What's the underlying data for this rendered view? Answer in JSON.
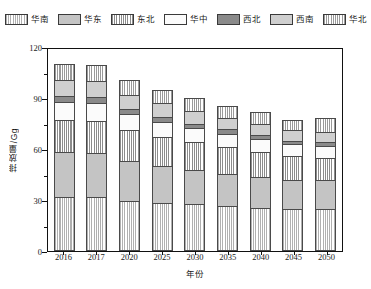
{
  "chart_data": {
    "type": "bar",
    "stacked": true,
    "title": "",
    "xlabel": "年份",
    "ylabel": "排放量/Gg",
    "categories": [
      "2016",
      "2017",
      "2020",
      "2025",
      "2030",
      "2035",
      "2040",
      "2045",
      "2050"
    ],
    "ylim": [
      0,
      120
    ],
    "yticks": [
      0,
      30,
      60,
      90,
      120
    ],
    "yticks_minor": [
      15,
      45,
      75,
      105
    ],
    "grid": false,
    "legend_position": "top",
    "series": [
      {
        "name": "华南",
        "color": "#b0b0b0",
        "pattern": "vertical-lines",
        "values": [
          32.0,
          31.5,
          29.5,
          28.5,
          27.5,
          26.5,
          25.5,
          25.0,
          25.0
        ]
      },
      {
        "name": "华东",
        "color": "#c4c4c4",
        "pattern": "solid",
        "values": [
          26.0,
          26.0,
          23.5,
          21.5,
          20.0,
          19.0,
          18.0,
          17.0,
          16.5
        ]
      },
      {
        "name": "东北",
        "color": "#8c8c8c",
        "pattern": "vertical-lines",
        "values": [
          19.0,
          19.0,
          18.0,
          17.0,
          16.5,
          15.5,
          15.0,
          14.0,
          13.5
        ]
      },
      {
        "name": "华中",
        "color": "#fbfbfb",
        "pattern": "solid",
        "values": [
          10.5,
          10.5,
          9.5,
          9.0,
          8.5,
          8.0,
          7.5,
          7.0,
          7.0
        ]
      },
      {
        "name": "西北",
        "color": "#8a8a8a",
        "pattern": "solid",
        "values": [
          3.5,
          3.5,
          3.0,
          3.0,
          2.5,
          2.5,
          2.5,
          2.0,
          2.0
        ]
      },
      {
        "name": "西南",
        "color": "#cfcfcf",
        "pattern": "solid",
        "values": [
          9.5,
          9.5,
          8.5,
          8.0,
          7.5,
          7.0,
          6.5,
          6.0,
          6.0
        ]
      },
      {
        "name": "华北",
        "color": "#9a9a9a",
        "pattern": "vertical-lines",
        "values": [
          9.5,
          9.5,
          8.5,
          8.0,
          7.5,
          7.0,
          6.5,
          6.0,
          8.0
        ]
      }
    ],
    "totals": [
      110.0,
      109.5,
      100.5,
      95.0,
      90.0,
      85.5,
      81.5,
      77.0,
      78.0
    ]
  },
  "axis": {
    "y_label": "排放量/Gg",
    "x_label": "年份",
    "y_tick_labels": [
      "0",
      "30",
      "60",
      "90",
      "120"
    ]
  }
}
